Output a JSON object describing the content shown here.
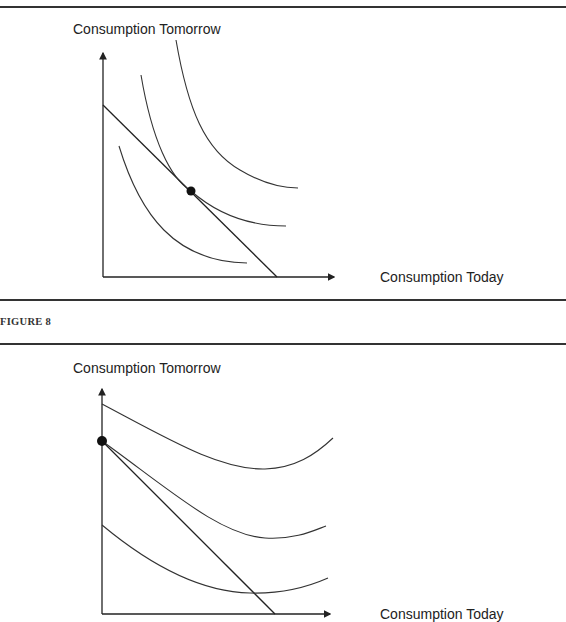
{
  "figure_top": {
    "y_axis_label": "Consumption Tomorrow",
    "x_axis_label": "Consumption Today",
    "description": "Three convex indifference curves with a budget line tangent to the middle curve at an interior point"
  },
  "caption": "FIGURE 8",
  "figure_bottom": {
    "y_axis_label": "Consumption Tomorrow",
    "x_axis_label": "Consumption Today",
    "description": "Three U-shaped indifference curves with a budget line; corner solution at the y-axis intercept"
  },
  "colors": {
    "ink": "#222222",
    "background": "#ffffff"
  }
}
